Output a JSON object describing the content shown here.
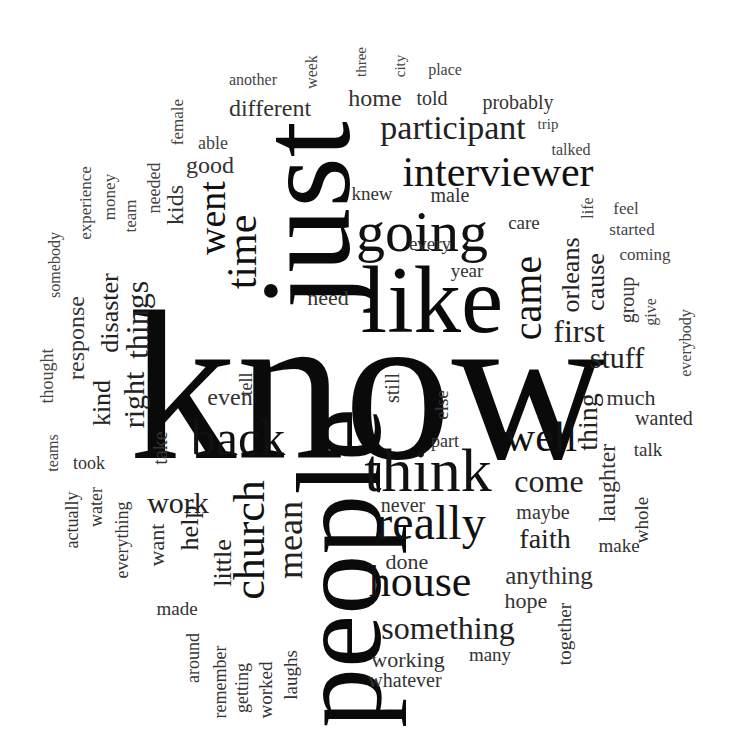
{
  "colors": {
    "background": "#ffffff",
    "largest": "#0a0a0a",
    "large": "#111111",
    "medium": "#222222",
    "small": "#333333",
    "tiny": "#444444"
  },
  "words": [
    {
      "text": "know",
      "size": 215,
      "x": 368,
      "y": 385,
      "orient": "h",
      "weight": "bold-ish",
      "color": "#0a0a0a"
    },
    {
      "text": "just",
      "size": 130,
      "x": 305,
      "y": 215,
      "orient": "v",
      "color": "#0a0a0a"
    },
    {
      "text": "people",
      "size": 120,
      "x": 340,
      "y": 568,
      "orient": "v",
      "color": "#0a0a0a"
    },
    {
      "text": "like",
      "size": 95,
      "x": 432,
      "y": 300,
      "orient": "h",
      "color": "#0a0a0a"
    },
    {
      "text": "think",
      "size": 62,
      "x": 428,
      "y": 470,
      "orient": "h",
      "color": "#111111"
    },
    {
      "text": "going",
      "size": 58,
      "x": 422,
      "y": 232,
      "orient": "h",
      "color": "#111111"
    },
    {
      "text": "interviewer",
      "size": 42,
      "x": 498,
      "y": 172,
      "orient": "h",
      "color": "#111111"
    },
    {
      "text": "back",
      "size": 50,
      "x": 238,
      "y": 438,
      "orient": "h",
      "color": "#111111"
    },
    {
      "text": "really",
      "size": 48,
      "x": 431,
      "y": 523,
      "orient": "h",
      "color": "#111111"
    },
    {
      "text": "house",
      "size": 44,
      "x": 420,
      "y": 582,
      "orient": "h",
      "color": "#111111"
    },
    {
      "text": "church",
      "size": 44,
      "x": 250,
      "y": 540,
      "orient": "v",
      "color": "#111111"
    },
    {
      "text": "time",
      "size": 42,
      "x": 242,
      "y": 252,
      "orient": "v",
      "color": "#111111"
    },
    {
      "text": "well",
      "size": 42,
      "x": 541,
      "y": 437,
      "orient": "h",
      "color": "#111111"
    },
    {
      "text": "came",
      "size": 40,
      "x": 528,
      "y": 298,
      "orient": "v",
      "color": "#111111"
    },
    {
      "text": "went",
      "size": 38,
      "x": 212,
      "y": 218,
      "orient": "v",
      "color": "#111111"
    },
    {
      "text": "participant",
      "size": 34,
      "x": 453,
      "y": 128,
      "orient": "h",
      "color": "#222222"
    },
    {
      "text": "mean",
      "size": 36,
      "x": 290,
      "y": 540,
      "orient": "v",
      "color": "#222222"
    },
    {
      "text": "something",
      "size": 32,
      "x": 448,
      "y": 628,
      "orient": "h",
      "color": "#222222"
    },
    {
      "text": "things",
      "size": 32,
      "x": 137,
      "y": 320,
      "orient": "v",
      "color": "#222222"
    },
    {
      "text": "come",
      "size": 32,
      "x": 549,
      "y": 481,
      "orient": "h",
      "color": "#222222"
    },
    {
      "text": "first",
      "size": 32,
      "x": 579,
      "y": 331,
      "orient": "h",
      "color": "#222222"
    },
    {
      "text": "work",
      "size": 30,
      "x": 178,
      "y": 503,
      "orient": "h",
      "color": "#222222"
    },
    {
      "text": "right",
      "size": 30,
      "x": 134,
      "y": 400,
      "orient": "v",
      "color": "#222222"
    },
    {
      "text": "stuff",
      "size": 30,
      "x": 617,
      "y": 358,
      "orient": "h",
      "color": "#222222"
    },
    {
      "text": "faith",
      "size": 28,
      "x": 545,
      "y": 539,
      "orient": "h",
      "color": "#222222"
    },
    {
      "text": "thing",
      "size": 28,
      "x": 588,
      "y": 422,
      "orient": "v",
      "color": "#222222"
    },
    {
      "text": "orleans",
      "size": 26,
      "x": 571,
      "y": 275,
      "orient": "v",
      "color": "#222222"
    },
    {
      "text": "cause",
      "size": 26,
      "x": 596,
      "y": 282,
      "orient": "v",
      "color": "#222222"
    },
    {
      "text": "kind",
      "size": 26,
      "x": 102,
      "y": 403,
      "orient": "v",
      "color": "#222222"
    },
    {
      "text": "disaster",
      "size": 26,
      "x": 110,
      "y": 313,
      "orient": "v",
      "color": "#222222"
    },
    {
      "text": "little",
      "size": 26,
      "x": 223,
      "y": 563,
      "orient": "v",
      "color": "#222222"
    },
    {
      "text": "help",
      "size": 26,
      "x": 190,
      "y": 528,
      "orient": "v",
      "color": "#222222"
    },
    {
      "text": "anything",
      "size": 25,
      "x": 549,
      "y": 575,
      "orient": "h",
      "color": "#333333"
    },
    {
      "text": "laughter",
      "size": 24,
      "x": 607,
      "y": 483,
      "orient": "v",
      "color": "#333333"
    },
    {
      "text": "response",
      "size": 24,
      "x": 76,
      "y": 338,
      "orient": "v",
      "color": "#333333"
    },
    {
      "text": "kids",
      "size": 24,
      "x": 175,
      "y": 205,
      "orient": "v",
      "color": "#333333"
    },
    {
      "text": "good",
      "size": 24,
      "x": 210,
      "y": 165,
      "orient": "h",
      "color": "#333333"
    },
    {
      "text": "different",
      "size": 24,
      "x": 270,
      "y": 108,
      "orient": "h",
      "color": "#333333"
    },
    {
      "text": "home",
      "size": 24,
      "x": 375,
      "y": 98,
      "orient": "h",
      "color": "#333333"
    },
    {
      "text": "even",
      "size": 24,
      "x": 230,
      "y": 397,
      "orient": "h",
      "color": "#333333"
    },
    {
      "text": "much",
      "size": 22,
      "x": 631,
      "y": 398,
      "orient": "h",
      "color": "#333333"
    },
    {
      "text": "want",
      "size": 22,
      "x": 157,
      "y": 545,
      "orient": "v",
      "color": "#333333"
    },
    {
      "text": "working",
      "size": 22,
      "x": 408,
      "y": 660,
      "orient": "h",
      "color": "#333333"
    },
    {
      "text": "hope",
      "size": 22,
      "x": 526,
      "y": 601,
      "orient": "h",
      "color": "#333333"
    },
    {
      "text": "done",
      "size": 22,
      "x": 407,
      "y": 562,
      "orient": "h",
      "color": "#333333"
    },
    {
      "text": "need",
      "size": 22,
      "x": 328,
      "y": 298,
      "orient": "h",
      "color": "#333333"
    },
    {
      "text": "probably",
      "size": 20,
      "x": 518,
      "y": 102,
      "orient": "h",
      "color": "#333333"
    },
    {
      "text": "told",
      "size": 20,
      "x": 432,
      "y": 98,
      "orient": "h",
      "color": "#333333"
    },
    {
      "text": "take",
      "size": 20,
      "x": 160,
      "y": 448,
      "orient": "v",
      "color": "#333333"
    },
    {
      "text": "group",
      "size": 20,
      "x": 627,
      "y": 300,
      "orient": "v",
      "color": "#333333"
    },
    {
      "text": "wanted",
      "size": 20,
      "x": 664,
      "y": 418,
      "orient": "h",
      "color": "#333333"
    },
    {
      "text": "whatever",
      "size": 20,
      "x": 405,
      "y": 680,
      "orient": "h",
      "color": "#333333"
    },
    {
      "text": "still",
      "size": 20,
      "x": 392,
      "y": 388,
      "orient": "v",
      "color": "#333333"
    },
    {
      "text": "maybe",
      "size": 20,
      "x": 543,
      "y": 512,
      "orient": "h",
      "color": "#333333"
    },
    {
      "text": "make",
      "size": 19,
      "x": 619,
      "y": 545,
      "orient": "h",
      "color": "#333333"
    },
    {
      "text": "never",
      "size": 20,
      "x": 403,
      "y": 505,
      "orient": "h",
      "color": "#333333"
    },
    {
      "text": "whole",
      "size": 19,
      "x": 641,
      "y": 520,
      "orient": "v",
      "color": "#333333"
    },
    {
      "text": "talk",
      "size": 19,
      "x": 648,
      "y": 449,
      "orient": "h",
      "color": "#333333"
    },
    {
      "text": "knew",
      "size": 19,
      "x": 372,
      "y": 193,
      "orient": "h",
      "color": "#333333"
    },
    {
      "text": "male",
      "size": 20,
      "x": 450,
      "y": 195,
      "orient": "h",
      "color": "#333333"
    },
    {
      "text": "care",
      "size": 19,
      "x": 524,
      "y": 222,
      "orient": "h",
      "color": "#333333"
    },
    {
      "text": "every",
      "size": 19,
      "x": 430,
      "y": 243,
      "orient": "h",
      "color": "#333333"
    },
    {
      "text": "year",
      "size": 19,
      "x": 467,
      "y": 270,
      "orient": "h",
      "color": "#333333"
    },
    {
      "text": "part",
      "size": 18,
      "x": 445,
      "y": 441,
      "orient": "h",
      "color": "#333333"
    },
    {
      "text": "else",
      "size": 19,
      "x": 441,
      "y": 405,
      "orient": "v",
      "color": "#333333"
    },
    {
      "text": "tell",
      "size": 18,
      "x": 246,
      "y": 384,
      "orient": "v",
      "color": "#333333"
    },
    {
      "text": "together",
      "size": 19,
      "x": 564,
      "y": 634,
      "orient": "v",
      "color": "#333333"
    },
    {
      "text": "many",
      "size": 19,
      "x": 490,
      "y": 654,
      "orient": "h",
      "color": "#333333"
    },
    {
      "text": "laughs",
      "size": 19,
      "x": 290,
      "y": 675,
      "orient": "v",
      "color": "#333333"
    },
    {
      "text": "worked",
      "size": 19,
      "x": 265,
      "y": 690,
      "orient": "v",
      "color": "#333333"
    },
    {
      "text": "getting",
      "size": 18,
      "x": 242,
      "y": 688,
      "orient": "v",
      "color": "#333333"
    },
    {
      "text": "remember",
      "size": 18,
      "x": 220,
      "y": 682,
      "orient": "v",
      "color": "#333333"
    },
    {
      "text": "around",
      "size": 18,
      "x": 193,
      "y": 658,
      "orient": "v",
      "color": "#333333"
    },
    {
      "text": "made",
      "size": 19,
      "x": 177,
      "y": 608,
      "orient": "h",
      "color": "#333333"
    },
    {
      "text": "everything",
      "size": 18,
      "x": 122,
      "y": 540,
      "orient": "v",
      "color": "#333333"
    },
    {
      "text": "water",
      "size": 18,
      "x": 96,
      "y": 507,
      "orient": "v",
      "color": "#333333"
    },
    {
      "text": "actually",
      "size": 18,
      "x": 72,
      "y": 520,
      "orient": "v",
      "color": "#333333"
    },
    {
      "text": "took",
      "size": 18,
      "x": 89,
      "y": 463,
      "orient": "h",
      "color": "#333333"
    },
    {
      "text": "teams",
      "size": 16,
      "x": 53,
      "y": 453,
      "orient": "v",
      "color": "#444444"
    },
    {
      "text": "thought",
      "size": 18,
      "x": 47,
      "y": 376,
      "orient": "v",
      "color": "#444444"
    },
    {
      "text": "somebody",
      "size": 16,
      "x": 55,
      "y": 265,
      "orient": "v",
      "color": "#444444"
    },
    {
      "text": "experience",
      "size": 17,
      "x": 85,
      "y": 203,
      "orient": "v",
      "color": "#444444"
    },
    {
      "text": "money",
      "size": 17,
      "x": 109,
      "y": 197,
      "orient": "v",
      "color": "#444444"
    },
    {
      "text": "team",
      "size": 17,
      "x": 130,
      "y": 216,
      "orient": "v",
      "color": "#444444"
    },
    {
      "text": "needed",
      "size": 18,
      "x": 154,
      "y": 188,
      "orient": "v",
      "color": "#444444"
    },
    {
      "text": "female",
      "size": 17,
      "x": 177,
      "y": 122,
      "orient": "v",
      "color": "#444444"
    },
    {
      "text": "able",
      "size": 18,
      "x": 213,
      "y": 143,
      "orient": "h",
      "color": "#444444"
    },
    {
      "text": "another",
      "size": 16,
      "x": 253,
      "y": 80,
      "orient": "h",
      "color": "#444444"
    },
    {
      "text": "week",
      "size": 16,
      "x": 312,
      "y": 72,
      "orient": "v",
      "color": "#444444"
    },
    {
      "text": "three",
      "size": 15,
      "x": 361,
      "y": 62,
      "orient": "v",
      "color": "#444444"
    },
    {
      "text": "city",
      "size": 15,
      "x": 400,
      "y": 66,
      "orient": "v",
      "color": "#444444"
    },
    {
      "text": "place",
      "size": 16,
      "x": 445,
      "y": 70,
      "orient": "h",
      "color": "#444444"
    },
    {
      "text": "trip",
      "size": 15,
      "x": 548,
      "y": 124,
      "orient": "h",
      "color": "#444444"
    },
    {
      "text": "talked",
      "size": 16,
      "x": 571,
      "y": 150,
      "orient": "h",
      "color": "#444444"
    },
    {
      "text": "feel",
      "size": 17,
      "x": 626,
      "y": 208,
      "orient": "h",
      "color": "#444444"
    },
    {
      "text": "started",
      "size": 17,
      "x": 632,
      "y": 229,
      "orient": "h",
      "color": "#444444"
    },
    {
      "text": "life",
      "size": 16,
      "x": 588,
      "y": 208,
      "orient": "v",
      "color": "#444444"
    },
    {
      "text": "coming",
      "size": 17,
      "x": 645,
      "y": 254,
      "orient": "h",
      "color": "#444444"
    },
    {
      "text": "give",
      "size": 16,
      "x": 651,
      "y": 312,
      "orient": "v",
      "color": "#444444"
    },
    {
      "text": "everybody",
      "size": 16,
      "x": 686,
      "y": 343,
      "orient": "v",
      "color": "#444444"
    }
  ]
}
